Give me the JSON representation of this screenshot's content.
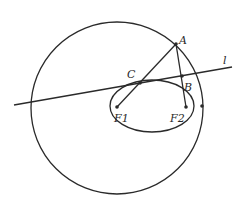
{
  "diagram": {
    "type": "geometry",
    "labels": {
      "A": "A",
      "B": "B",
      "C": "C",
      "F1": "F1",
      "F2": "F2",
      "l": "l"
    },
    "colors": {
      "stroke": "#2a2a2a",
      "background": "#ffffff"
    }
  }
}
